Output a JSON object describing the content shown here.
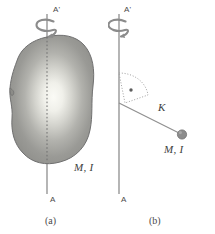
{
  "figure": {
    "width": 215,
    "height": 234,
    "background": "#ffffff",
    "kind": "physics-diagram",
    "topic": "moment of inertia and radius of gyration about axis A-A'"
  },
  "colors": {
    "axis_line": "#8e8e8e",
    "body_fill_dark": "#8f8f8f",
    "body_fill_light": "#f7f7f2",
    "body_outline": "#6f6f6f",
    "dashed_line": "#7a7a7a",
    "dotted_guide": "#9b9b9b",
    "point_mass": "#8a8a8a",
    "text": "#3d3d3d",
    "label_gray": "#4a4a4a"
  },
  "panel_a": {
    "caption": "(a)",
    "axis_top_label": "A'",
    "axis_bottom_label": "A",
    "body_label": "M, I",
    "rotation_indicator": "rotation-curl-arrow",
    "body_shape": "irregular-blob",
    "centerline_style": "dashed"
  },
  "panel_b": {
    "caption": "(b)",
    "axis_top_label": "A'",
    "axis_bottom_label": "A",
    "radius_label": "K",
    "mass_label": "M, I",
    "rotation_indicator": "rotation-curl-arrow",
    "point_mass_shape": "filled-circle",
    "guide_style": "dotted"
  }
}
